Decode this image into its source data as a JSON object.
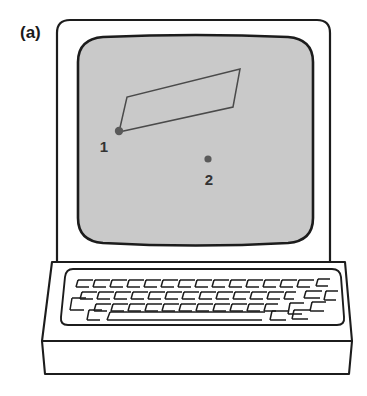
{
  "figure": {
    "panel_label": "(a)",
    "background_color": "#ffffff",
    "ink_color": "#1c1c1c",
    "screen_fill_color": "#c9c9c9",
    "marker_color": "#5a5a5a",
    "polygon_stroke_color": "#4a4a4a"
  },
  "device": {
    "name": "desktop-computer",
    "monitor": {
      "case": {
        "x": 57,
        "y": 20,
        "width": 273,
        "height": 242,
        "corner_radius": 13
      },
      "screen": {
        "x": 78,
        "y": 37,
        "width": 235,
        "height": 208,
        "corner_radius": 26
      }
    },
    "keyboard_deck": {
      "top_y": 262,
      "bottom_y": 341
    },
    "base": {
      "top_y": 341,
      "bottom_y": 376
    }
  },
  "screen_content": {
    "type": "line-drawing",
    "polygon": {
      "name": "quadrilateral-region",
      "closed": true,
      "vertices": [
        {
          "x": 119,
          "y": 132
        },
        {
          "x": 127,
          "y": 97
        },
        {
          "x": 240,
          "y": 69
        },
        {
          "x": 233,
          "y": 107
        }
      ]
    },
    "markers": [
      {
        "label": "1",
        "x": 119,
        "y": 131,
        "radius": 4.2,
        "label_x": 104,
        "label_y": 152
      },
      {
        "label": "2",
        "x": 208,
        "y": 159,
        "radius": 3.6,
        "label_x": 209,
        "label_y": 185
      }
    ]
  },
  "keyboard": {
    "well": {
      "x": 62,
      "y": 268,
      "width": 275,
      "height": 58,
      "corner_radius": 11
    },
    "rows": [
      {
        "keys": 15,
        "start_x": 72,
        "y": 276,
        "key_width": 15.5,
        "skew": 4.5
      },
      {
        "keys": 14,
        "start_x": 76,
        "y": 287,
        "key_width": 15.5,
        "skew": 4.5
      },
      {
        "keys": 13,
        "start_x": 81,
        "y": 298,
        "key_width": 15.5,
        "skew": 4.5
      },
      {
        "keys": 1,
        "start_x": 90,
        "y": 309,
        "key_width": 160,
        "skew": 4.5
      }
    ]
  }
}
